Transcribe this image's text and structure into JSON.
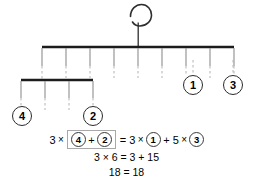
{
  "diagram": {
    "type": "balance-mobile",
    "hook": {
      "shape": "hook-spiral"
    },
    "top_bar": {
      "x_start": 42,
      "x_end": 234,
      "y": 47,
      "tick_positions": [
        42,
        66,
        90,
        114,
        138,
        162,
        186,
        210,
        234
      ],
      "pivot_x": 138
    },
    "sub_bar": {
      "x_start": 21,
      "x_end": 93,
      "y": 80,
      "tick_positions": [
        21,
        45,
        69,
        93
      ],
      "suspended_from_tick_x": 42
    },
    "weights": [
      {
        "label": "4",
        "x": 22,
        "y": 116
      },
      {
        "label": "2",
        "x": 93,
        "y": 116
      },
      {
        "label": "1",
        "x": 193,
        "y": 85
      },
      {
        "label": "3",
        "x": 233,
        "y": 85
      }
    ],
    "colors": {
      "bar": "#1c1c1c",
      "tick": "#888888",
      "dash": "#b0b0b0",
      "circle_stroke": "#2b2b2b",
      "bracket_stroke": "#a8a8a8"
    }
  },
  "equation": {
    "line1": {
      "lhs_coefficient": "3",
      "mult_symbol": "×",
      "bracket_terms": [
        "4",
        "2"
      ],
      "bracket_plus": "+",
      "equals": "=",
      "rhs_first_coefficient": "3",
      "rhs_first_circle": "1",
      "rhs_plus": "+",
      "rhs_second_coefficient": "5",
      "rhs_second_circle": "3"
    },
    "line2": "3 × 6 = 3 + 15",
    "line3": "18 = 18"
  }
}
